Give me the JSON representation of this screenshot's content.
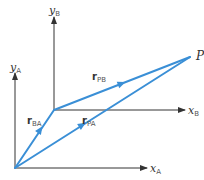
{
  "diagram": {
    "type": "relative-position-vectors",
    "colors": {
      "axis": "#333333",
      "vector": "#3a8fd6"
    },
    "frame_A": {
      "origin": [
        15,
        168
      ],
      "x_axis": {
        "label_main": "x",
        "label_sub": "A"
      },
      "y_axis": {
        "label_main": "y",
        "label_sub": "A"
      }
    },
    "frame_B": {
      "origin": [
        54,
        110
      ],
      "x_axis": {
        "label_main": "x",
        "label_sub": "B"
      },
      "y_axis": {
        "label_main": "y",
        "label_sub": "B"
      }
    },
    "point": {
      "label": "P",
      "position": [
        190,
        57
      ]
    },
    "vectors": [
      {
        "name": "r_BA",
        "main": "r",
        "sub": "BA",
        "from": "origin A",
        "to": "origin B"
      },
      {
        "name": "r_PB",
        "main": "r",
        "sub": "PB",
        "from": "origin B",
        "to": "P"
      },
      {
        "name": "r_PA",
        "main": "r",
        "sub": "PA",
        "from": "origin A",
        "to": "P"
      }
    ]
  }
}
